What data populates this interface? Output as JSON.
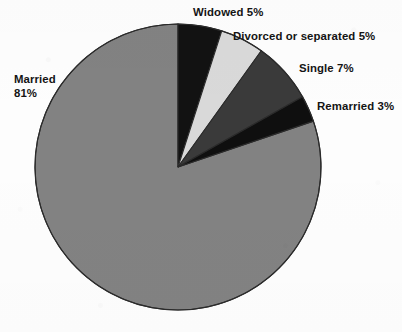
{
  "chart_data": {
    "type": "pie",
    "title": "",
    "subtitle": "",
    "xlabel": "",
    "ylabel": "",
    "legend_position": "none",
    "grid": false,
    "units": "percent",
    "total": 101,
    "start_angle_deg": 0,
    "direction": "clockwise",
    "categories": [
      "Widowed",
      "Divorced or separated",
      "Single",
      "Remarried",
      "Married"
    ],
    "values": [
      5,
      5,
      7,
      3,
      81
    ],
    "slices": [
      {
        "label": "Widowed",
        "value": 5,
        "value_text": "5%",
        "label_text": "Widowed 5%",
        "color": "#121212",
        "start_deg": 0,
        "end_deg": 17.8
      },
      {
        "label": "Divorced or separated",
        "value": 5,
        "value_text": "5%",
        "label_text": "Divorced or separated 5%",
        "color": "#d9d9d9",
        "start_deg": 17.8,
        "end_deg": 35.6
      },
      {
        "label": "Single",
        "value": 7,
        "value_text": "7%",
        "label_text": "Single 7%",
        "color": "#3a3a3a",
        "start_deg": 35.6,
        "end_deg": 60.6
      },
      {
        "label": "Remarried",
        "value": 3,
        "value_text": "3%",
        "label_text": "Remarried 3%",
        "color": "#0f0f0f",
        "start_deg": 60.6,
        "end_deg": 71.3
      },
      {
        "label": "Married",
        "value": 81,
        "value_text": "81%",
        "label_text": "Married 81%",
        "color": "#828282",
        "start_deg": 71.3,
        "end_deg": 360
      }
    ],
    "labels": {
      "widowed": "Widowed 5%",
      "divorced": "Divorced or separated 5%",
      "single": "Single 7%",
      "remarried": "Remarried 3%",
      "married_line1": "Married",
      "married_line2": "81%"
    },
    "colors": {
      "background": "#fdfdfd",
      "outline": "#2b2b2b",
      "text": "#141414",
      "widowed": "#121212",
      "divorced": "#d9d9d9",
      "single": "#3a3a3a",
      "remarried": "#0f0f0f",
      "married": "#828282"
    },
    "geometry": {
      "center_x": 178,
      "center_y": 167,
      "radius": 143
    }
  }
}
